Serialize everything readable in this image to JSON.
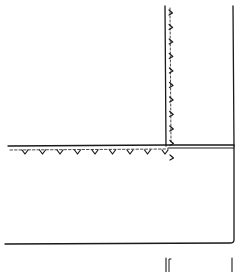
{
  "diagram": {
    "type": "line-sketch",
    "background": "#ffffff",
    "ink_color": "#1a1a1a",
    "canvas": {
      "width": 238,
      "height": 272
    },
    "vertical_strip": {
      "left_x": 166,
      "right_x": 234,
      "top_y": 6,
      "bottom_y": 146
    },
    "horizontal_band": {
      "left_x": 8,
      "right_x": 234,
      "y": 145
    },
    "lower_box": {
      "left_x": 4,
      "right_x": 234,
      "top_y": 148,
      "bottom_y": 243
    },
    "vertical_ticks": {
      "x": 169,
      "count": 11,
      "start_y": 10,
      "spacing": 14.5
    },
    "horizontal_ticks": {
      "y": 150,
      "count": 9,
      "start_x": 25,
      "spacing": 17.5
    },
    "bottom_fragments": {
      "left_bracket_x": 168,
      "right_line_x": 232,
      "top_y": 258
    }
  }
}
